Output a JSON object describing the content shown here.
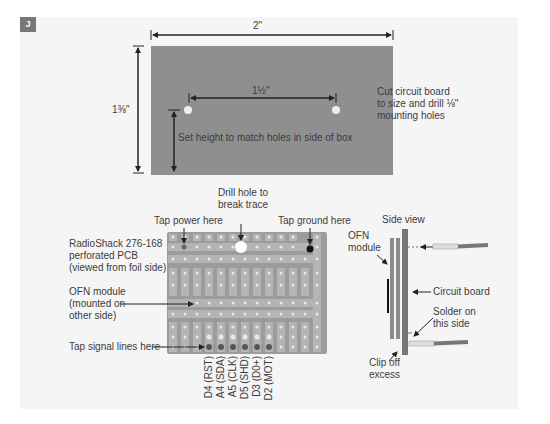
{
  "figure": {
    "badge": "J",
    "colors": {
      "board": "#8f8f8f",
      "panel": "#f5f5f5",
      "pcb": "#9c9c9c",
      "strip": "#bdbdbd",
      "hole": "#e4e4e4",
      "signal_dot": "#555555"
    }
  },
  "top_diagram": {
    "width_dim": "2\"",
    "height_dim": "1⅜\"",
    "hole_spacing_dim": "1½\"",
    "height_note": "Set height to match holes in side of box",
    "instruction": [
      "Cut circuit board",
      "to size and drill ⅛\"",
      "mounting holes"
    ]
  },
  "pcb_diagram": {
    "drill_note": [
      "Drill hole to",
      "break trace"
    ],
    "tap_power": "Tap power here",
    "tap_ground": "Tap ground here",
    "pcb_label": [
      "RadioShack 276-168",
      "perforated PCB",
      "(viewed from foil side)"
    ],
    "ofn_label": [
      "OFN module",
      "(mounted on",
      "other side)"
    ],
    "tap_signal": "Tap signal lines here",
    "signal_labels": [
      "D4 (RST)",
      "A4 (SDA)",
      "A5 (CLK)",
      "D5 (SHD)",
      "D3 (D0+)",
      "D2 (MOT)"
    ]
  },
  "side_view": {
    "title": "Side view",
    "ofn_module": [
      "OFN",
      "module"
    ],
    "circuit_board": "Circuit board",
    "solder_note": [
      "Solder on",
      "this side"
    ],
    "clip_note": [
      "Clip off",
      "excess"
    ]
  }
}
